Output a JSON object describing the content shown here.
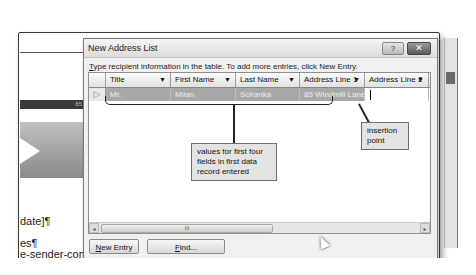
{
  "background_document": {
    "band_text": "85 C",
    "text_lines": [
      "date]¶",
      "es¶",
      "e-sender-com"
    ]
  },
  "dialog": {
    "title": "New Address List",
    "help_button": "?",
    "close_button": "✕",
    "instruction_prefix": "T",
    "instruction_rest": "ype recipient information in the table.  To add more entries, click New Entry.",
    "columns": [
      {
        "label": "Title",
        "dropdown": "▼"
      },
      {
        "label": "First Name",
        "dropdown": "▼"
      },
      {
        "label": "Last Name",
        "dropdown": "▼"
      },
      {
        "label": "Address Line 1",
        "dropdown": "▼"
      },
      {
        "label": "Address Line 2",
        "dropdown": "▼"
      }
    ],
    "rows": [
      {
        "selector": "▷",
        "cells": [
          "Mr.",
          "Milan",
          "Sciranka",
          "85 Windmill Lane",
          ""
        ]
      }
    ],
    "scrollbar": {
      "left_arrow": "◂",
      "right_arrow": "▸",
      "thumb_grip": "III"
    },
    "buttons": {
      "new_entry_prefix": "N",
      "new_entry_rest": "ew Entry",
      "find_prefix": "F",
      "find_rest": "ind..."
    }
  },
  "callouts": {
    "values": "values for first four fields in first data record entered",
    "insertion": "insertion point"
  }
}
